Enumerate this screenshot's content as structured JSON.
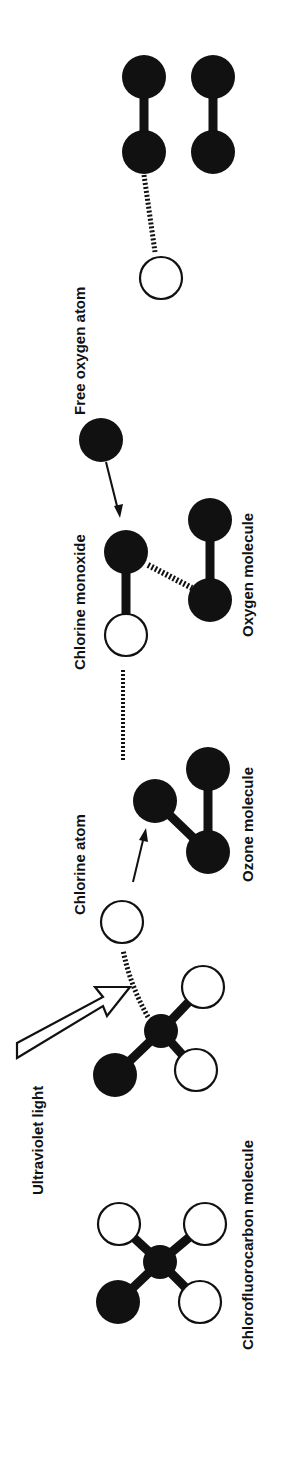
{
  "diagram": {
    "orientation": "rotated 90 degrees counter-clockwise",
    "labels": {
      "cfc": "Chlorofluorocarbon molecule",
      "uv": "Ultraviolet light",
      "chlorine_atom": "Chlorine atom",
      "ozone": "Ozone molecule",
      "chlorine_monoxide": "Chlorine monoxide",
      "oxygen_molecule": "Oxygen molecule",
      "free_oxygen": "Free oxygen atom"
    },
    "colors": {
      "dark_atom": "#111111",
      "light_atom": "#ffffff",
      "ink": "#111111",
      "background": "#ffffff"
    },
    "stages": [
      {
        "name": "Chlorofluorocarbon molecule",
        "atoms": [
          "carbon (dark)",
          "chlorine (dark)",
          "fluorine (light)",
          "fluorine (light)",
          "chlorine (light)"
        ]
      },
      {
        "name": "UV breaks chlorine atom off CFC",
        "atoms": [
          "carbon (dark)",
          "chlorine (dark)",
          "fluorine (light)",
          "fluorine (light)",
          "chlorine atom released (light)"
        ]
      },
      {
        "name": "Chlorine atom attacks ozone molecule",
        "atoms": [
          "oxygen",
          "oxygen",
          "oxygen"
        ]
      },
      {
        "name": "Chlorine monoxide + oxygen molecule; free oxygen atom approaches",
        "atoms": [
          "chlorine (light)",
          "oxygen (dark)",
          "oxygen molecule (2 dark)",
          "free oxygen (dark)"
        ]
      },
      {
        "name": "Chlorine atom freed; two oxygen molecules formed",
        "atoms": [
          "chlorine (light)",
          "oxygen molecule (2 dark)",
          "oxygen molecule (2 dark)"
        ]
      }
    ]
  }
}
